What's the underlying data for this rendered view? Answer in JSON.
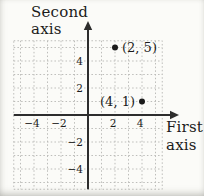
{
  "figure": {
    "type_hint": "textbook coordinate-plane figure",
    "background": "#fbfbf8"
  },
  "chart_data": {
    "type": "scatter",
    "title": "",
    "xlabel_lines": [
      "First",
      "axis"
    ],
    "ylabel_lines": [
      "Second",
      "axis"
    ],
    "xlim": [
      -5.5,
      5.5
    ],
    "ylim": [
      -5.5,
      5.5
    ],
    "grid": true,
    "grid_step": 1,
    "x_ticks": [
      {
        "value": -4,
        "label": "−4"
      },
      {
        "value": -2,
        "label": "−2"
      },
      {
        "value": 2,
        "label": "2"
      },
      {
        "value": 4,
        "label": "4"
      }
    ],
    "y_ticks": [
      {
        "value": 4,
        "label": "4"
      },
      {
        "value": 2,
        "label": "2"
      },
      {
        "value": -2,
        "label": "−2"
      },
      {
        "value": -4,
        "label": "−4"
      }
    ],
    "points": [
      {
        "x": 2,
        "y": 5,
        "label": "(2, 5)",
        "label_side": "right"
      },
      {
        "x": 4,
        "y": 1,
        "label": "(4, 1)",
        "label_side": "left"
      }
    ],
    "legend": null,
    "colors": {
      "grid": "#bdbdba",
      "axis": "#2d2d2d",
      "point": "#1b1b1b",
      "text": "#1b1b1b",
      "background": "#fbfbf8"
    }
  }
}
